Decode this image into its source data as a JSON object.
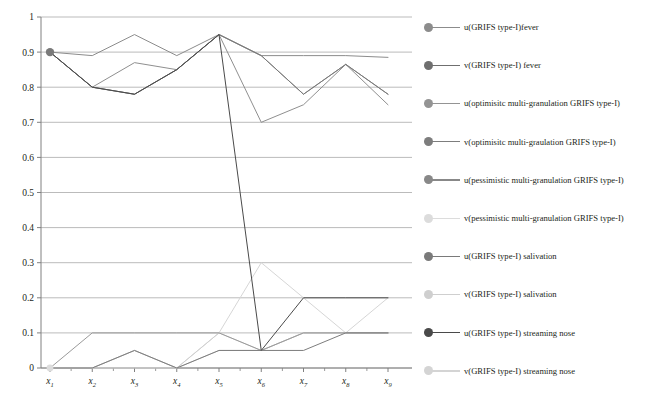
{
  "chart_data": {
    "type": "line",
    "title": "",
    "xlabel": "",
    "ylabel": "",
    "ylim": [
      0,
      1
    ],
    "ytick_values": [
      0,
      0.1,
      0.2,
      0.3,
      0.4,
      0.5,
      0.6,
      0.7,
      0.8,
      0.9,
      1
    ],
    "ytick_labels": [
      "0",
      "0.1",
      "0.2",
      "0.3",
      "0.4",
      "0.5",
      "0.6",
      "0.7",
      "0.8",
      "0.9",
      "1"
    ],
    "grid": "horizontal",
    "legend_position": "right",
    "categories": [
      "x1",
      "x2",
      "x3",
      "x4",
      "x5",
      "x6",
      "x7",
      "x8",
      "x9"
    ],
    "xtick_base": [
      "x",
      "x",
      "x",
      "x",
      "x",
      "x",
      "x",
      "x",
      "x"
    ],
    "xtick_sub": [
      "1",
      "2",
      "3",
      "4",
      "5",
      "6",
      "7",
      "8",
      "9"
    ],
    "series": [
      {
        "name": "u(GRIFS type-I)fever",
        "color": "#8c8c8c",
        "values": [
          0.9,
          0.89,
          0.95,
          0.89,
          0.95,
          0.89,
          0.89,
          0.89,
          0.885
        ]
      },
      {
        "name": "v(GRIFS type-I) fever",
        "color": "#9a9a9a",
        "values": [
          0,
          0.1,
          0.1,
          0.1,
          0.1,
          0.05,
          0.1,
          0.1,
          0.1
        ]
      },
      {
        "name": "u(optimisitc multi-granulation GRIFS type-I)",
        "color": "#8f8f8f",
        "values": [
          0.9,
          0.8,
          0.87,
          0.85,
          0.95,
          0.7,
          0.75,
          0.865,
          0.75
        ]
      },
      {
        "name": "v(optimisitc multi-graulation GRIFS type-I)",
        "color": "#7d7d7d",
        "values": [
          0,
          0,
          0.05,
          0,
          0.05,
          0.05,
          0.05,
          0.1,
          0.1
        ]
      },
      {
        "name": "u(pessimistic multi-granulation GRIFS type-I)",
        "color": "#888888",
        "values": [
          0.9,
          0.8,
          0.78,
          0.85,
          0.95,
          0.89,
          0.78,
          0.865,
          0.78
        ]
      },
      {
        "name": "v(pessimistic multi-granulation GRIFS type-I)",
        "color": "#d6d6d6",
        "values": [
          0,
          0,
          0,
          0,
          0.1,
          0.3,
          0.2,
          0.1,
          0.2
        ]
      },
      {
        "name": "u(GRIFS type-I) salivation",
        "color": "#7a7a7a",
        "values": [
          0.9,
          0.8,
          0.78,
          0.85,
          0.95,
          0.89,
          0.78,
          0.865,
          0.78
        ]
      },
      {
        "name": "v(GRIFS type-I) salivation",
        "color": "#c9c9c9",
        "values": [
          0,
          0,
          0.05,
          0,
          0.05,
          0.05,
          0.1,
          0.1,
          0.1
        ]
      },
      {
        "name": "u(GRIFS type-I) streaming nose",
        "color": "#4a4a4a",
        "values": [
          0.9,
          0.8,
          0.78,
          0.85,
          0.95,
          0.05,
          0.2,
          0.2,
          0.2
        ]
      },
      {
        "name": "v(GRIFS type-I) streaming nose",
        "color": "#d0d0d0",
        "values": [
          0,
          0,
          0.05,
          0,
          0.1,
          0.05,
          0.1,
          0.1,
          0.1
        ]
      }
    ],
    "start_marker": {
      "x": "x1",
      "y": 0.9,
      "color": "#7a7a7a"
    }
  },
  "legend": {
    "items": [
      {
        "label": "u(GRIFS type-I)fever",
        "color": "#8c8c8c"
      },
      {
        "label": "v(GRIFS type-I) fever",
        "color": "#6f6f6f"
      },
      {
        "label": "u(optimisitc multi-granulation GRIFS type-I)",
        "color": "#949494"
      },
      {
        "label": "v(optimisitc multi-graulation GRIFS type-I)",
        "color": "#7d7d7d"
      },
      {
        "label": "u(pessimistic multi-granulation GRIFS type-I)",
        "color": "#888888"
      },
      {
        "label": "v(pessimistic multi-granulation GRIFS type-I)",
        "color": "#dcdcdc"
      },
      {
        "label": "u(GRIFS type-I) salivation",
        "color": "#7a7a7a"
      },
      {
        "label": "v(GRIFS type-I) salivation",
        "color": "#cfcfcf"
      },
      {
        "label": "u(GRIFS type-I) streaming nose",
        "color": "#4a4a4a"
      },
      {
        "label": "v(GRIFS type-I) streaming nose",
        "color": "#d4d4d4"
      }
    ]
  },
  "axis": {
    "line_color": "#808080",
    "grid_color": "#9e9e9e"
  }
}
